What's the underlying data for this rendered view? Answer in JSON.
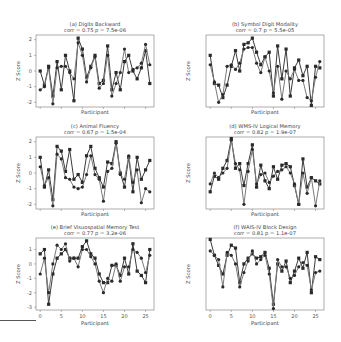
{
  "chart_data": [
    {
      "type": "line",
      "title": "(a) Digits Backward",
      "subtitle": "corr = 0.75  p = 7.5e-06",
      "xlabel": "Participant",
      "ylabel": "Z Score",
      "ylim": [
        -2.3,
        2.3
      ],
      "yticks": [
        -2,
        -1,
        0,
        1,
        2
      ],
      "xlim": [
        -1,
        27
      ],
      "xticks": [
        0,
        5,
        10,
        15,
        20,
        25
      ],
      "grid": false,
      "series": [
        {
          "name": "Series A",
          "marker": "square",
          "values": [
            0.0,
            -0.9,
            0.3,
            -1.6,
            0.6,
            -1.2,
            1.0,
            0.0,
            -1.9,
            2.1,
            1.4,
            -0.4,
            0.3,
            1.0,
            -0.8,
            -0.6,
            1.6,
            -1.2,
            -0.1,
            -1.2,
            0.6,
            1.0,
            0.0,
            -0.5,
            0.2,
            1.3,
            -0.8
          ]
        },
        {
          "name": "Series B",
          "marker": "circle",
          "values": [
            -1.2,
            -1.0,
            0.2,
            -2.1,
            0.2,
            0.3,
            0.3,
            -0.1,
            -0.5,
            1.8,
            1.0,
            -0.7,
            0.2,
            0.9,
            -1.1,
            -0.8,
            1.0,
            -1.6,
            -0.8,
            -0.1,
            1.4,
            -0.1,
            0.1,
            0.2,
            0.5,
            1.7,
            0.4
          ]
        }
      ]
    },
    {
      "type": "line",
      "title": "(b) Symbol Digit Modality",
      "subtitle": "corr = 0.7  p = 5.5e-05",
      "xlabel": "Participant",
      "ylabel": "Z Score",
      "ylim": [
        -2.3,
        2.3
      ],
      "xlim": [
        -1,
        27
      ],
      "xticks": [
        0,
        5,
        10,
        15,
        20,
        25
      ],
      "grid": false,
      "series": [
        {
          "name": "Series A",
          "marker": "square",
          "values": [
            1.0,
            -0.8,
            -0.9,
            -1.7,
            -0.9,
            0.3,
            1.3,
            0.0,
            1.7,
            1.8,
            2.1,
            1.2,
            0.4,
            0.9,
            1.2,
            -1.6,
            1.6,
            -0.5,
            1.4,
            -1.6,
            0.2,
            0.7,
            -0.3,
            0.3,
            -2.2,
            0.3,
            0.2
          ]
        },
        {
          "name": "Series B",
          "marker": "circle",
          "values": [
            0.4,
            -0.7,
            -2.0,
            -1.5,
            0.3,
            0.4,
            0.1,
            0.5,
            1.4,
            1.5,
            1.5,
            0.5,
            -0.1,
            0.9,
            0.0,
            -1.4,
            0.3,
            -1.8,
            0.0,
            -0.5,
            0.1,
            -0.6,
            -0.6,
            -1.7,
            -1.9,
            -0.4,
            0.6
          ]
        }
      ]
    },
    {
      "type": "line",
      "title": "(c) Animal Fluency",
      "subtitle": "corr = 0.67  p = 1.5e-04",
      "xlabel": "Participant",
      "ylabel": "Z Score",
      "ylim": [
        -2.3,
        2.3
      ],
      "yticks": [
        -2,
        -1,
        0,
        1,
        2
      ],
      "xlim": [
        -1,
        27
      ],
      "xticks": [
        0,
        5,
        10,
        15,
        20,
        25
      ],
      "grid": false,
      "series": [
        {
          "name": "Series A",
          "marker": "square",
          "values": [
            1.0,
            -0.9,
            0.2,
            -1.7,
            1.7,
            1.4,
            0.1,
            1.5,
            -0.4,
            -0.1,
            -0.6,
            1.1,
            1.7,
            0.3,
            -0.3,
            -0.9,
            0.7,
            0.6,
            2.0,
            0.0,
            -0.9,
            1.0,
            -1.2,
            1.0,
            -0.4,
            0.2,
            0.8
          ]
        },
        {
          "name": "Series B",
          "marker": "circle",
          "values": [
            0.4,
            -0.8,
            -0.3,
            -2.1,
            1.2,
            0.9,
            -0.3,
            -0.4,
            -0.9,
            -1.0,
            -0.9,
            -0.1,
            1.1,
            -0.1,
            -0.4,
            -1.8,
            0.1,
            0.3,
            1.9,
            -0.1,
            -0.4,
            1.1,
            -0.6,
            0.2,
            -1.9,
            -1.0,
            -1.2
          ]
        }
      ]
    },
    {
      "type": "line",
      "title": "(d) WMS-IV Logical Memory",
      "subtitle": "corr = 0.82  p = 1.9e-07",
      "xlabel": "Participant",
      "ylabel": "Z Score",
      "ylim": [
        -2.3,
        2.3
      ],
      "xlim": [
        -1,
        27
      ],
      "xticks": [
        0,
        5,
        10,
        15,
        20,
        25
      ],
      "grid": false,
      "series": [
        {
          "name": "Series A",
          "marker": "square",
          "values": [
            -1.2,
            -0.2,
            -0.4,
            0.3,
            0.8,
            2.2,
            0.3,
            0.6,
            -0.8,
            0.6,
            1.8,
            -0.9,
            0.5,
            -0.5,
            -1.0,
            0.4,
            -0.4,
            0.5,
            0.6,
            0.4,
            -0.8,
            -2.0,
            0.9,
            -0.9,
            -0.3,
            -0.5,
            -0.7
          ]
        },
        {
          "name": "Series B",
          "marker": "circle",
          "values": [
            -0.7,
            0.0,
            -0.3,
            0.0,
            0.3,
            2.1,
            0.6,
            0.2,
            -2.0,
            0.1,
            1.5,
            -0.7,
            -0.1,
            0.0,
            -0.6,
            -0.2,
            0.1,
            0.2,
            0.4,
            0.0,
            -0.7,
            -2.0,
            0.0,
            -1.3,
            -0.3,
            -2.1,
            -0.5
          ]
        }
      ]
    },
    {
      "type": "line",
      "title": "(e) Brief Visuospatial Memory Test",
      "subtitle": "corr = 0.77  p = 3.2e-06",
      "xlabel": "Participant",
      "ylabel": "Z Score",
      "ylim": [
        -3.2,
        1.8
      ],
      "yticks": [
        -3,
        -2,
        -1,
        0,
        1
      ],
      "xlim": [
        -1,
        27
      ],
      "xticks": [
        0,
        5,
        10,
        15,
        20,
        25
      ],
      "xticklabels": [
        "0",
        "5",
        "10",
        "15",
        "20",
        "25"
      ],
      "grid": false,
      "series": [
        {
          "name": "Series A",
          "marker": "square",
          "values": [
            0.7,
            1.0,
            -2.8,
            -0.7,
            0.4,
            0.7,
            1.0,
            0.4,
            0.4,
            0.4,
            1.2,
            1.6,
            0.7,
            0.4,
            -0.7,
            -1.3,
            -1.3,
            -0.1,
            -0.1,
            -0.8,
            0.4,
            -0.7,
            1.4,
            -0.5,
            -0.8,
            -1.3,
            1.0
          ]
        },
        {
          "name": "Series B",
          "marker": "circle",
          "values": [
            -0.7,
            0.4,
            -2.0,
            0.0,
            1.3,
            1.0,
            1.4,
            0.2,
            0.4,
            -0.2,
            1.0,
            1.0,
            0.5,
            0.0,
            -1.2,
            -2.0,
            -1.0,
            -1.2,
            0.0,
            -1.2,
            -0.2,
            -0.2,
            1.0,
            0.8,
            0.4,
            -0.6,
            0.6
          ]
        }
      ]
    },
    {
      "type": "line",
      "title": "(f) WAIS-IV Block Design",
      "subtitle": "corr = 0.81  p = 1.1e-07",
      "xlabel": "Participant",
      "ylabel": "Z Score",
      "ylim": [
        -3.2,
        1.8
      ],
      "xlim": [
        -1,
        27
      ],
      "xticks": [
        0,
        5,
        10,
        15,
        20,
        25
      ],
      "xticklabels": [
        "0",
        "5",
        "10",
        "15",
        "20",
        "25"
      ],
      "grid": false,
      "series": [
        {
          "name": "Series A",
          "marker": "square",
          "values": [
            1.7,
            0.6,
            -0.1,
            -0.7,
            0.6,
            1.3,
            1.1,
            -1.3,
            0.0,
            0.4,
            0.7,
            0.4,
            0.5,
            0.8,
            -0.3,
            -2.8,
            0.0,
            -0.5,
            0.2,
            -1.3,
            -0.5,
            0.4,
            -0.3,
            0.8,
            -2.0,
            0.5,
            0.3
          ]
        },
        {
          "name": "Series B",
          "marker": "circle",
          "values": [
            0.9,
            0.6,
            0.3,
            -1.6,
            0.8,
            0.6,
            0.0,
            -1.6,
            -0.6,
            0.2,
            0.9,
            0.0,
            0.3,
            0.6,
            -0.7,
            -3.1,
            0.3,
            -0.2,
            -0.2,
            -1.0,
            -0.8,
            -0.2,
            0.1,
            -0.1,
            -1.8,
            -0.6,
            -0.5
          ]
        }
      ]
    }
  ]
}
